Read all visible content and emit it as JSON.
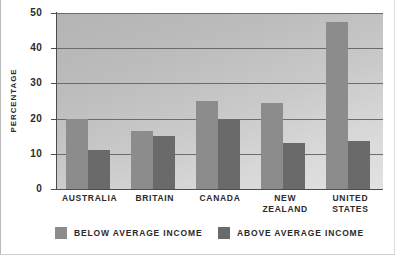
{
  "chart_data": {
    "type": "bar",
    "title": "",
    "subtitle": "",
    "xlabel": "",
    "ylabel": "PERCENTAGE",
    "ylim": [
      0,
      50
    ],
    "yticks": [
      0,
      10,
      20,
      30,
      40,
      50
    ],
    "ytick_labels": [
      "0",
      "10",
      "20",
      "30",
      "40",
      "50"
    ],
    "grid": true,
    "grid_axis": "y",
    "legend_position": "bottom",
    "categories": [
      "AUSTRALIA",
      "BRITAIN",
      "CANADA",
      "NEW ZEALAND",
      "UNITED STATES"
    ],
    "category_lines": [
      [
        "AUSTRALIA"
      ],
      [
        "BRITAIN"
      ],
      [
        "CANADA"
      ],
      [
        "NEW",
        "ZEALAND"
      ],
      [
        "UNITED",
        "STATES"
      ]
    ],
    "series": [
      {
        "name": "BELOW AVERAGE INCOME",
        "color": "#8c8c8c",
        "values": [
          20,
          16.5,
          25,
          24.5,
          47.5
        ]
      },
      {
        "name": "ABOVE AVERAGE INCOME",
        "color": "#6a6a6a",
        "values": [
          11,
          15,
          20,
          13,
          13.5
        ]
      }
    ],
    "annotations": []
  },
  "legend": {
    "items": [
      {
        "label": "BELOW AVERAGE INCOME",
        "swatch": "below"
      },
      {
        "label": "ABOVE AVERAGE INCOME",
        "swatch": "above"
      }
    ]
  },
  "colors": {
    "below_average": "#8c8c8c",
    "above_average": "#6a6a6a",
    "plot_background": "#c6c6c6",
    "gridline": "#6c6c6c",
    "axis": "#4c4c4c",
    "text": "#2b2b2b",
    "page_background": "#ffffff"
  }
}
